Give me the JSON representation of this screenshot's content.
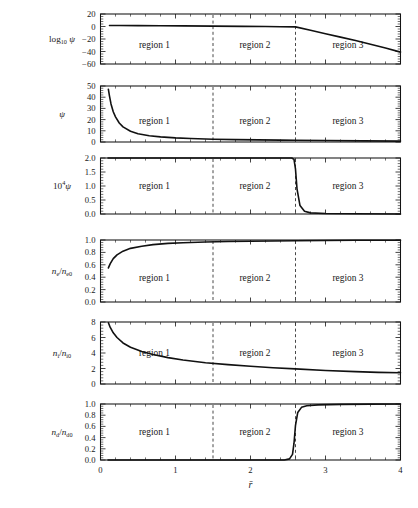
{
  "figure": {
    "xlabel": "r̄",
    "x_axis": {
      "min": 0,
      "max": 4,
      "ticks": [
        0,
        1,
        2,
        3,
        4
      ],
      "ticklabels": [
        "0",
        "1",
        "2",
        "3",
        "4"
      ],
      "minor_per_major": 5
    },
    "region_boundaries": [
      1.5,
      2.6
    ],
    "region_labels": [
      "region 1",
      "region 2",
      "region 3"
    ],
    "region_label_positions": [
      0.72,
      2.06,
      3.3
    ]
  },
  "chart_data": [
    {
      "type": "line",
      "panel": 1,
      "ylabel": "log₁₀ ψ",
      "ylabel_parts": {
        "base": "log",
        "sub": "10",
        "var": "ψ"
      },
      "ylim": [
        -60,
        20
      ],
      "yticks": [
        -60,
        -40,
        -20,
        0,
        20
      ],
      "yticklabels": [
        "−60",
        "−40",
        "−20",
        "0",
        "20"
      ],
      "xlim": [
        0,
        4
      ],
      "grid": false,
      "x": [
        0.12,
        0.25,
        0.5,
        0.8,
        1.1,
        1.5,
        1.9,
        2.2,
        2.4,
        2.6,
        2.8,
        3.0,
        3.2,
        3.4,
        3.6,
        3.8,
        4.0
      ],
      "y": [
        1.7,
        1.6,
        1.4,
        1.2,
        1.0,
        0.6,
        0.2,
        -0.1,
        -0.3,
        -0.6,
        -6.0,
        -11.5,
        -17.0,
        -22.5,
        -28.5,
        -34.5,
        -41.0
      ]
    },
    {
      "type": "line",
      "panel": 2,
      "ylabel": "ψ",
      "ylim": [
        0,
        50
      ],
      "yticks": [
        0,
        10,
        20,
        30,
        40,
        50
      ],
      "yticklabels": [
        "0",
        "10",
        "20",
        "30",
        "40",
        "50"
      ],
      "xlim": [
        0,
        4
      ],
      "grid": false,
      "x": [
        0.105,
        0.12,
        0.14,
        0.17,
        0.2,
        0.25,
        0.3,
        0.4,
        0.5,
        0.65,
        0.8,
        1.0,
        1.2,
        1.5,
        1.8,
        2.1,
        2.4,
        2.6,
        3.0,
        3.5,
        4.0
      ],
      "y": [
        47.0,
        41.0,
        34.0,
        27.0,
        22.5,
        17.0,
        13.5,
        9.6,
        7.4,
        5.6,
        4.6,
        3.7,
        3.1,
        2.5,
        2.1,
        1.9,
        1.7,
        1.6,
        1.3,
        1.0,
        0.8
      ]
    },
    {
      "type": "line",
      "panel": 3,
      "ylabel": "10⁴ ψ",
      "ylabel_parts": {
        "base": "10",
        "sup": "4",
        "var": "ψ"
      },
      "ylim": [
        0.0,
        2.0
      ],
      "yticks": [
        0.0,
        0.5,
        1.0,
        1.5,
        2.0
      ],
      "yticklabels": [
        "0.0",
        "0.5",
        "1.0",
        "1.5",
        "2.0"
      ],
      "xlim": [
        0,
        4
      ],
      "grid": false,
      "x": [
        0.1,
        1.0,
        2.0,
        2.45,
        2.55,
        2.58,
        2.6,
        2.62,
        2.66,
        2.72,
        2.8,
        3.0,
        3.4,
        4.0
      ],
      "y": [
        2.0,
        2.0,
        2.0,
        2.0,
        2.0,
        1.95,
        1.6,
        0.9,
        0.3,
        0.1,
        0.04,
        0.02,
        0.01,
        0.0
      ]
    },
    {
      "type": "line",
      "panel": 4,
      "ylabel": "nₑ/nₑ₀",
      "ylabel_parts": {
        "base": "n",
        "sub1": "e",
        "denom": "n",
        "sub2": "e0"
      },
      "ylim": [
        0.0,
        1.0
      ],
      "yticks": [
        0.0,
        0.2,
        0.4,
        0.6,
        0.8,
        1.0
      ],
      "yticklabels": [
        "0.0",
        "0.2",
        "0.4",
        "0.6",
        "0.8",
        "1.0"
      ],
      "xlim": [
        0,
        4
      ],
      "grid": false,
      "x": [
        0.105,
        0.13,
        0.17,
        0.22,
        0.3,
        0.4,
        0.55,
        0.7,
        0.9,
        1.1,
        1.4,
        1.7,
        2.0,
        2.3,
        2.6,
        3.0,
        3.4,
        4.0
      ],
      "y": [
        0.55,
        0.62,
        0.7,
        0.76,
        0.82,
        0.865,
        0.9,
        0.925,
        0.945,
        0.955,
        0.968,
        0.975,
        0.98,
        0.985,
        0.988,
        0.992,
        0.995,
        0.997
      ]
    },
    {
      "type": "line",
      "panel": 5,
      "ylabel": "nᵢ/nᵢ₀",
      "ylabel_parts": {
        "base": "n",
        "sub1": "i",
        "denom": "n",
        "sub2": "i0"
      },
      "ylim": [
        0,
        8
      ],
      "yticks": [
        0,
        2,
        4,
        6,
        8
      ],
      "yticklabels": [
        "0",
        "2",
        "4",
        "6",
        "8"
      ],
      "xlim": [
        0,
        4
      ],
      "grid": false,
      "x": [
        0.105,
        0.13,
        0.17,
        0.22,
        0.3,
        0.4,
        0.55,
        0.7,
        0.9,
        1.1,
        1.4,
        1.7,
        2.0,
        2.3,
        2.6,
        3.0,
        3.4,
        3.7,
        4.0
      ],
      "y": [
        7.9,
        7.3,
        6.6,
        6.0,
        5.3,
        4.75,
        4.2,
        3.8,
        3.4,
        3.1,
        2.75,
        2.5,
        2.3,
        2.1,
        1.95,
        1.75,
        1.6,
        1.5,
        1.45
      ]
    },
    {
      "type": "line",
      "panel": 6,
      "ylabel": "n_d/n_d0",
      "ylabel_parts": {
        "base": "n",
        "sub1": "d",
        "denom": "n",
        "sub2": "d0"
      },
      "ylim": [
        0.0,
        1.0
      ],
      "yticks": [
        0.0,
        0.2,
        0.4,
        0.6,
        0.8,
        1.0
      ],
      "yticklabels": [
        "0.0",
        "0.2",
        "0.4",
        "0.6",
        "0.8",
        "1.0"
      ],
      "xlim": [
        0,
        4
      ],
      "grid": false,
      "x": [
        0.1,
        1.0,
        2.0,
        2.45,
        2.52,
        2.56,
        2.58,
        2.6,
        2.63,
        2.68,
        2.75,
        2.9,
        3.2,
        3.6,
        4.0
      ],
      "y": [
        0.0,
        0.0,
        0.0,
        0.0,
        0.02,
        0.1,
        0.3,
        0.62,
        0.85,
        0.94,
        0.97,
        0.985,
        0.993,
        0.997,
        1.0
      ]
    }
  ]
}
